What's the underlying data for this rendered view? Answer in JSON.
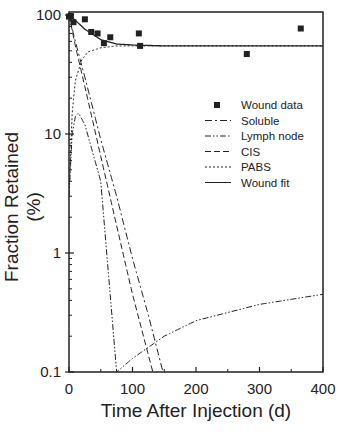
{
  "chart_data": {
    "type": "line",
    "title": "",
    "xlabel": "Time After Injection (d)",
    "ylabel": "Fraction Retained (%)",
    "xlim": [
      0,
      400
    ],
    "ylim": [
      0.1,
      100
    ],
    "yscale": "log",
    "xticks": [
      0,
      100,
      200,
      300,
      400
    ],
    "yticks": [
      0.1,
      1,
      10,
      100
    ],
    "xtick_labels": [
      "0",
      "100",
      "200",
      "300",
      "400"
    ],
    "ytick_labels": [
      "0.1",
      "1",
      "10",
      "100"
    ],
    "grid": false,
    "legend_position": "right-center inside",
    "legend": [
      "Wound data",
      "Soluble",
      "Lymph node",
      "CIS",
      "PABS",
      "Wound fit"
    ],
    "series": [
      {
        "name": "Wound data",
        "style": "square-markers",
        "x": [
          0,
          3,
          7,
          25,
          35,
          45,
          55,
          65,
          110,
          112,
          280,
          365
        ],
        "y": [
          97,
          98,
          87,
          92,
          72,
          70,
          58,
          65,
          70,
          55,
          47,
          77
        ]
      },
      {
        "name": "Soluble",
        "style": "dash-dot",
        "x": [
          0,
          10,
          25,
          50,
          75,
          100,
          125,
          148
        ],
        "y": [
          100,
          60,
          30,
          9,
          3,
          0.9,
          0.3,
          0.1
        ]
      },
      {
        "name": "Lymph node",
        "style": "dash-dot-dot",
        "x": [
          0,
          5,
          10,
          15,
          25,
          50,
          75,
          100,
          150,
          200,
          300,
          400
        ],
        "y": [
          3,
          10,
          14,
          15,
          12,
          4,
          0.1,
          0.13,
          0.2,
          0.27,
          0.37,
          0.45
        ]
      },
      {
        "name": "CIS",
        "style": "dashed",
        "x": [
          0,
          10,
          25,
          50,
          75,
          100,
          132
        ],
        "y": [
          100,
          55,
          25,
          6.5,
          1.7,
          0.45,
          0.1
        ]
      },
      {
        "name": "PABS",
        "style": "dotted",
        "x": [
          0,
          5,
          10,
          20,
          30,
          50,
          75,
          100,
          150,
          400
        ],
        "y": [
          3,
          15,
          28,
          42,
          49,
          53,
          55,
          55,
          55,
          55
        ]
      },
      {
        "name": "Wound fit",
        "style": "solid",
        "x": [
          0,
          10,
          25,
          50,
          75,
          100,
          150,
          400
        ],
        "y": [
          100,
          90,
          76,
          62,
          57,
          56,
          55,
          55
        ]
      }
    ]
  }
}
